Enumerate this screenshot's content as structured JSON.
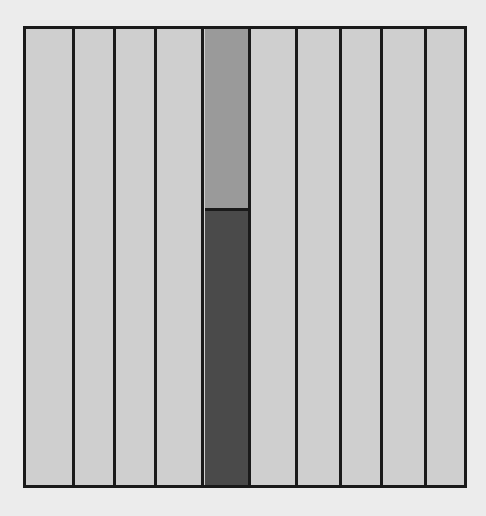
{
  "diagram": {
    "type": "fraction-strip",
    "total_columns": 10,
    "shaded_column_index": 4,
    "shaded_light_fraction": 0.4,
    "shaded_dark_fraction": 0.6,
    "colors": {
      "background": "#ececec",
      "column_fill": "#cfcfcf",
      "shaded_light": "#9a9a9a",
      "shaded_dark": "#4a4a4a",
      "border": "#1a1a1a"
    },
    "column_edges_px": [
      0,
      47,
      88,
      129,
      176,
      223,
      270,
      314,
      355,
      399,
      441
    ]
  },
  "caption": ""
}
